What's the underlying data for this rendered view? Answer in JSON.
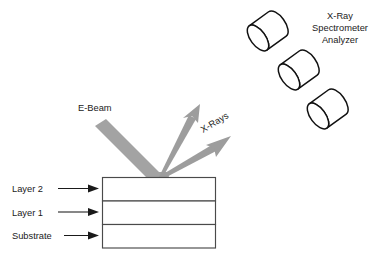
{
  "diagram": {
    "background_color": "#ffffff",
    "beam_color": "#a3a3a3",
    "xray_color": "#9d9d9d",
    "outline_color": "#4a4a4a",
    "cylinder_outline_color": "#111111",
    "text_color": "#1a1a1a"
  },
  "labels": {
    "ebeam": "E-Beam",
    "xrays": "X-Rays",
    "detector_line1": "X-Ray",
    "detector_line2": "Spectrometer",
    "detector_line3": "Analyzer"
  },
  "stack": {
    "rows": [
      {
        "label": "Layer 2"
      },
      {
        "label": "Layer 1"
      },
      {
        "label": "Substrate"
      }
    ]
  },
  "detectors": {
    "count": 3,
    "items": [
      {
        "name": "detector-1"
      },
      {
        "name": "detector-2"
      },
      {
        "name": "detector-3"
      }
    ]
  }
}
